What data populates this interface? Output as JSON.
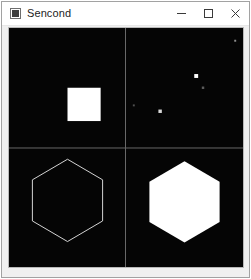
{
  "window": {
    "title": "Sencond",
    "icon": "app-icon",
    "background_color": "#f0f0f0",
    "border_color": "#a2a2a2",
    "titlebar_color": "#ffffff",
    "title_color": "#1b1b1b"
  },
  "controls": {
    "minimize": {
      "label": "─",
      "name": "minimize-icon",
      "tooltip": "Minimize"
    },
    "maximize": {
      "label": "□",
      "name": "maximize-icon",
      "tooltip": "Maximize"
    },
    "close": {
      "label": "✕",
      "name": "close-icon",
      "tooltip": "Close"
    }
  },
  "canvas": {
    "background_color": "#050505",
    "shape_color": "#ffffff",
    "divider_color": "#6a6a6a",
    "viewbox": "0 0 240 244",
    "divider": {
      "vertical_x": 119.5,
      "horizontal_y": 122.5
    },
    "quadrants": [
      {
        "id": "top-left",
        "content": "filled-square",
        "shape": {
          "type": "rect",
          "x": 60,
          "y": 61,
          "width": 34,
          "height": 34,
          "fill": "#ffffff",
          "stroke": "none"
        }
      },
      {
        "id": "top-right",
        "content": "scattered-points",
        "points": [
          {
            "x": 232,
            "y": 13,
            "size": 2,
            "opacity": 0.55
          },
          {
            "x": 192,
            "y": 49,
            "size": 4,
            "opacity": 1
          },
          {
            "x": 199,
            "y": 61,
            "size": 2.5,
            "opacity": 0.35
          },
          {
            "x": 155,
            "y": 85,
            "size": 3.5,
            "opacity": 0.85
          },
          {
            "x": 128,
            "y": 79,
            "size": 2,
            "opacity": 0.3
          }
        ]
      },
      {
        "id": "bottom-left",
        "content": "hexagon-outline",
        "shape": {
          "type": "polygon",
          "points": "60,134 96,155 96,197 60,218 24,197 24,155",
          "fill": "none",
          "stroke": "#d8d8d8",
          "stroke_width": 1
        }
      },
      {
        "id": "bottom-right",
        "content": "hexagon-filled",
        "shape": {
          "type": "polygon",
          "points": "180,136 216,157 216,198 180,219 144,198 144,157",
          "fill": "#ffffff",
          "stroke": "none"
        }
      }
    ]
  }
}
